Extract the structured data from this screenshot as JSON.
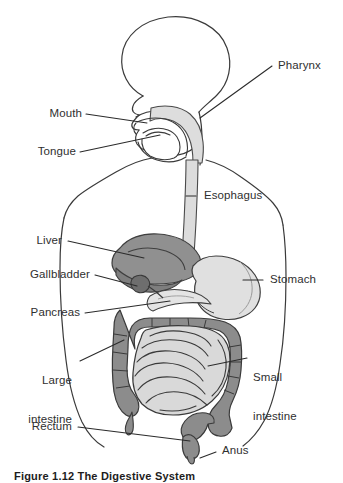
{
  "figure": {
    "caption": "Figure 1.12 The Digestive System",
    "title": "The Digestive System"
  },
  "colors": {
    "outline": "#3a3a3a",
    "leader_line": "#2b2b2b",
    "label_text": "#2f2f2f",
    "background": "#ffffff",
    "organ_dark": "#8f8f8f",
    "organ_mid": "#a8a8a8",
    "organ_light": "#d2d2d2",
    "organ_pale": "#e2e2e2",
    "esophagus": "#dcdcdc"
  },
  "labels": {
    "pharynx": "Pharynx",
    "mouth": "Mouth",
    "tongue": "Tongue",
    "esophagus": "Esophagus",
    "liver": "Liver",
    "gallbladder": "Gallbladder",
    "pancreas": "Pancreas",
    "stomach": "Stomach",
    "large_intestine_line1": "Large",
    "large_intestine_line2": "intestine",
    "small_intestine_line1": "Small",
    "small_intestine_line2": "intestine",
    "rectum": "Rectum",
    "anus": "Anus"
  },
  "parts": [
    {
      "id": "pharynx",
      "name": "Pharynx",
      "side": "right"
    },
    {
      "id": "mouth",
      "name": "Mouth",
      "side": "left"
    },
    {
      "id": "tongue",
      "name": "Tongue",
      "side": "left"
    },
    {
      "id": "esophagus",
      "name": "Esophagus",
      "side": "right"
    },
    {
      "id": "liver",
      "name": "Liver",
      "side": "left"
    },
    {
      "id": "gallbladder",
      "name": "Gallbladder",
      "side": "left"
    },
    {
      "id": "pancreas",
      "name": "Pancreas",
      "side": "left"
    },
    {
      "id": "stomach",
      "name": "Stomach",
      "side": "right"
    },
    {
      "id": "large-intestine",
      "name": "Large intestine",
      "side": "left"
    },
    {
      "id": "small-intestine",
      "name": "Small intestine",
      "side": "right"
    },
    {
      "id": "rectum",
      "name": "Rectum",
      "side": "left"
    },
    {
      "id": "anus",
      "name": "Anus",
      "side": "right"
    }
  ]
}
